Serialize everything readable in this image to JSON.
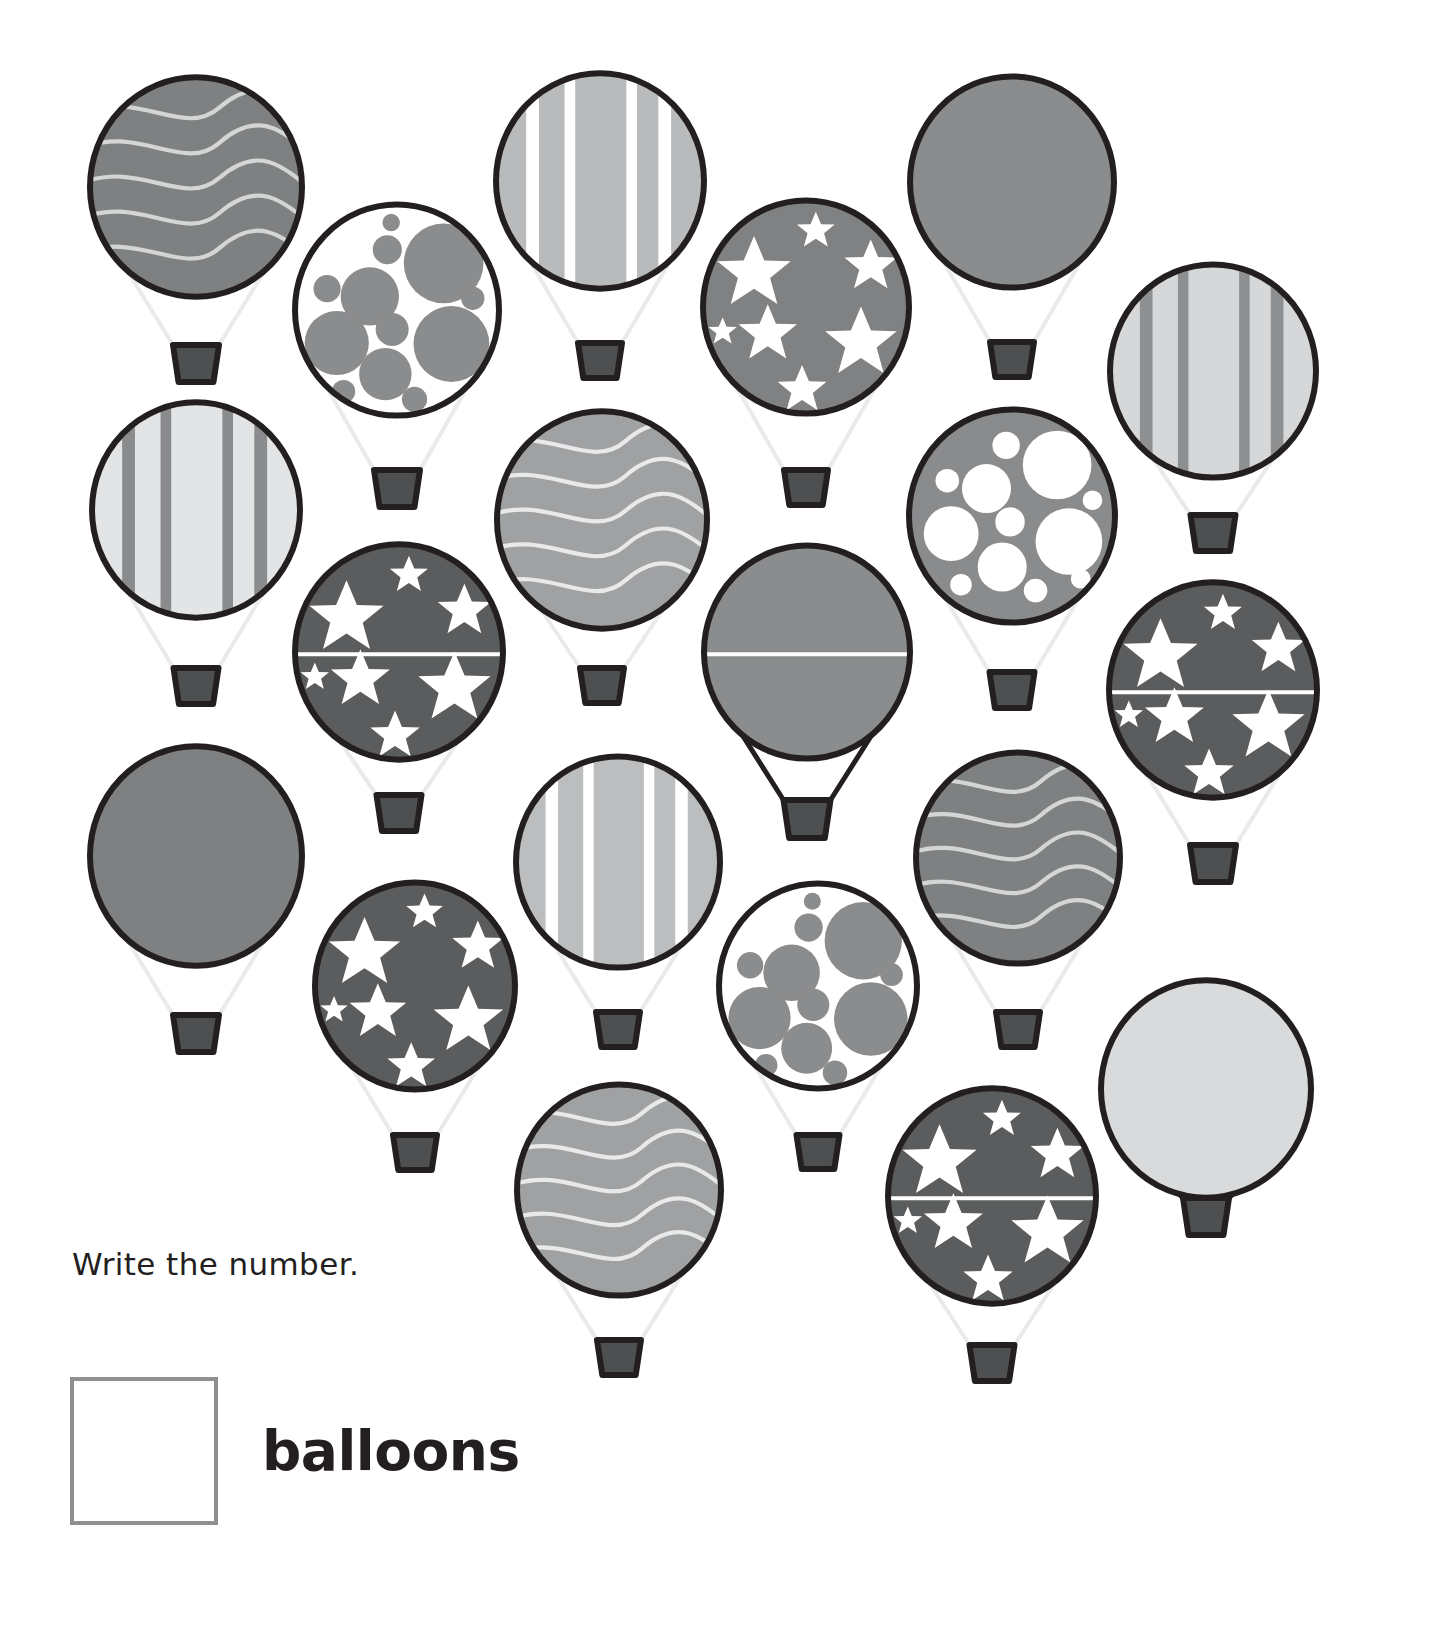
{
  "worksheet": {
    "prompt": "Write the number.",
    "answer_label": "balloons",
    "answer_value": "",
    "subject": "counting",
    "object_counted": "hot air balloons",
    "total_balloons": 20
  },
  "palette": {
    "background": "#ffffff",
    "outline_dark": "#231f20",
    "basket_fill": "#4d4f50",
    "gray_medium": "#7f8081",
    "gray_light": "#9b9c9d",
    "gray_lighter": "#b5b6b7",
    "gray_pale": "#d9dadb",
    "gray_dark": "#5b5c5d",
    "rope_light": "#e9eaea",
    "answer_box_border": "#8f9091",
    "text": "#231f20"
  },
  "legend": {
    "patterns": [
      "wavy",
      "dots-dark-on-light",
      "stripes",
      "stars-on-gray",
      "plain",
      "dots-light-on-dark",
      "stars-on-dark"
    ]
  },
  "balloons": [
    {
      "id": 1,
      "pattern": "wavy",
      "row": 1,
      "col": 1,
      "cx": 196,
      "cy": 187,
      "r": 106,
      "fill": "#7f8081",
      "accent": "#d4d5d6",
      "rope": "light",
      "basket_y": 345,
      "basket_w": 46
    },
    {
      "id": 2,
      "pattern": "dots-dark-on-light",
      "row": 1,
      "col": 2,
      "cx": 397,
      "cy": 310,
      "r": 102,
      "fill": "#ffffff",
      "accent": "#8b8c8d",
      "rope": "light",
      "basket_y": 470,
      "basket_w": 46
    },
    {
      "id": 3,
      "pattern": "stripes",
      "row": 1,
      "col": 3,
      "cx": 600,
      "cy": 181,
      "r": 104,
      "fill": "#ffffff",
      "accent": "#b9babb",
      "rope": "light",
      "basket_y": 343,
      "basket_w": 44
    },
    {
      "id": 4,
      "pattern": "stars-on-gray",
      "row": 1,
      "col": 4,
      "cx": 806,
      "cy": 307,
      "r": 103,
      "fill": "#808182",
      "accent": "#ffffff",
      "rope": "light",
      "basket_y": 470,
      "basket_w": 44
    },
    {
      "id": 5,
      "pattern": "plain",
      "row": 1,
      "col": 5,
      "cx": 1012,
      "cy": 182,
      "r": 102,
      "fill": "#8b8c8d",
      "accent": "#8b8c8d",
      "rope": "light",
      "basket_y": 342,
      "basket_w": 44
    },
    {
      "id": 6,
      "pattern": "stripes",
      "row": 1,
      "col": 6,
      "cx": 1213,
      "cy": 371,
      "r": 103,
      "fill": "#8e8f90",
      "accent": "#d6d7d8",
      "rope": "light",
      "basket_y": 515,
      "basket_w": 45
    },
    {
      "id": 7,
      "pattern": "stripes",
      "row": 2,
      "col": 1,
      "cx": 196,
      "cy": 510,
      "r": 104,
      "fill": "#8a8b8c",
      "accent": "#e3e4e5",
      "rope": "light",
      "basket_y": 668,
      "basket_w": 45
    },
    {
      "id": 8,
      "pattern": "stars-on-dark",
      "row": 2,
      "col": 2,
      "cx": 399,
      "cy": 652,
      "r": 104,
      "fill": "#5b5c5d",
      "accent": "#ffffff",
      "rope": "light",
      "basket_y": 795,
      "basket_w": 45,
      "seam": true
    },
    {
      "id": 9,
      "pattern": "wavy",
      "row": 2,
      "col": 3,
      "cx": 602,
      "cy": 520,
      "r": 105,
      "fill": "#a0a1a2",
      "accent": "#e8e9ea",
      "rope": "light",
      "basket_y": 668,
      "basket_w": 44
    },
    {
      "id": 10,
      "pattern": "plain",
      "row": 2,
      "col": 4,
      "cx": 807,
      "cy": 652,
      "r": 103,
      "fill": "#8b8c8d",
      "accent": "#8b8c8d",
      "rope": "dark",
      "basket_y": 800,
      "basket_w": 47,
      "seam": true
    },
    {
      "id": 11,
      "pattern": "dots-light-on-dark",
      "row": 2,
      "col": 5,
      "cx": 1012,
      "cy": 516,
      "r": 103,
      "fill": "#8a8b8c",
      "accent": "#ffffff",
      "rope": "light",
      "basket_y": 672,
      "basket_w": 45
    },
    {
      "id": 12,
      "pattern": "stars-on-dark",
      "row": 2,
      "col": 6,
      "cx": 1213,
      "cy": 690,
      "r": 104,
      "fill": "#5b5c5d",
      "accent": "#ffffff",
      "rope": "light",
      "basket_y": 845,
      "basket_w": 46,
      "seam": true
    },
    {
      "id": 13,
      "pattern": "plain",
      "row": 3,
      "col": 1,
      "cx": 196,
      "cy": 856,
      "r": 106,
      "fill": "#7f8081",
      "accent": "#7f8081",
      "rope": "light",
      "basket_y": 1015,
      "basket_w": 46
    },
    {
      "id": 14,
      "pattern": "stars-on-dark",
      "row": 3,
      "col": 2,
      "cx": 415,
      "cy": 986,
      "r": 100,
      "fill": "#5b5c5d",
      "accent": "#ffffff",
      "rope": "light",
      "basket_y": 1135,
      "basket_w": 44
    },
    {
      "id": 15,
      "pattern": "stripes",
      "row": 3,
      "col": 3,
      "cx": 618,
      "cy": 862,
      "r": 102,
      "fill": "#ffffff",
      "accent": "#bcbdbe",
      "rope": "light",
      "basket_y": 1012,
      "basket_w": 44
    },
    {
      "id": 16,
      "pattern": "dots-dark-on-light",
      "row": 3,
      "col": 4,
      "cx": 818,
      "cy": 986,
      "r": 99,
      "fill": "#ffffff",
      "accent": "#8b8c8d",
      "rope": "light",
      "basket_y": 1135,
      "basket_w": 43
    },
    {
      "id": 17,
      "pattern": "wavy",
      "row": 3,
      "col": 5,
      "cx": 1018,
      "cy": 858,
      "r": 102,
      "fill": "#7f8081",
      "accent": "#d4d5d6",
      "rope": "light",
      "basket_y": 1012,
      "basket_w": 44
    },
    {
      "id": 18,
      "pattern": "plain",
      "row": 3,
      "col": 6,
      "cx": 1206,
      "cy": 1089,
      "r": 105,
      "fill": "#d9dadb",
      "accent": "#d9dadb",
      "rope": "dark",
      "basket_y": 1198,
      "basket_w": 46
    },
    {
      "id": 19,
      "pattern": "wavy",
      "row": 4,
      "col": 3,
      "cx": 619,
      "cy": 1190,
      "r": 102,
      "fill": "#a0a1a2",
      "accent": "#e8e9ea",
      "rope": "light",
      "basket_y": 1340,
      "basket_w": 44
    },
    {
      "id": 20,
      "pattern": "stars-on-dark",
      "row": 4,
      "col": 5,
      "cx": 992,
      "cy": 1196,
      "r": 104,
      "fill": "#5b5c5d",
      "accent": "#ffffff",
      "rope": "light",
      "basket_y": 1345,
      "basket_w": 45,
      "seam": true
    }
  ]
}
